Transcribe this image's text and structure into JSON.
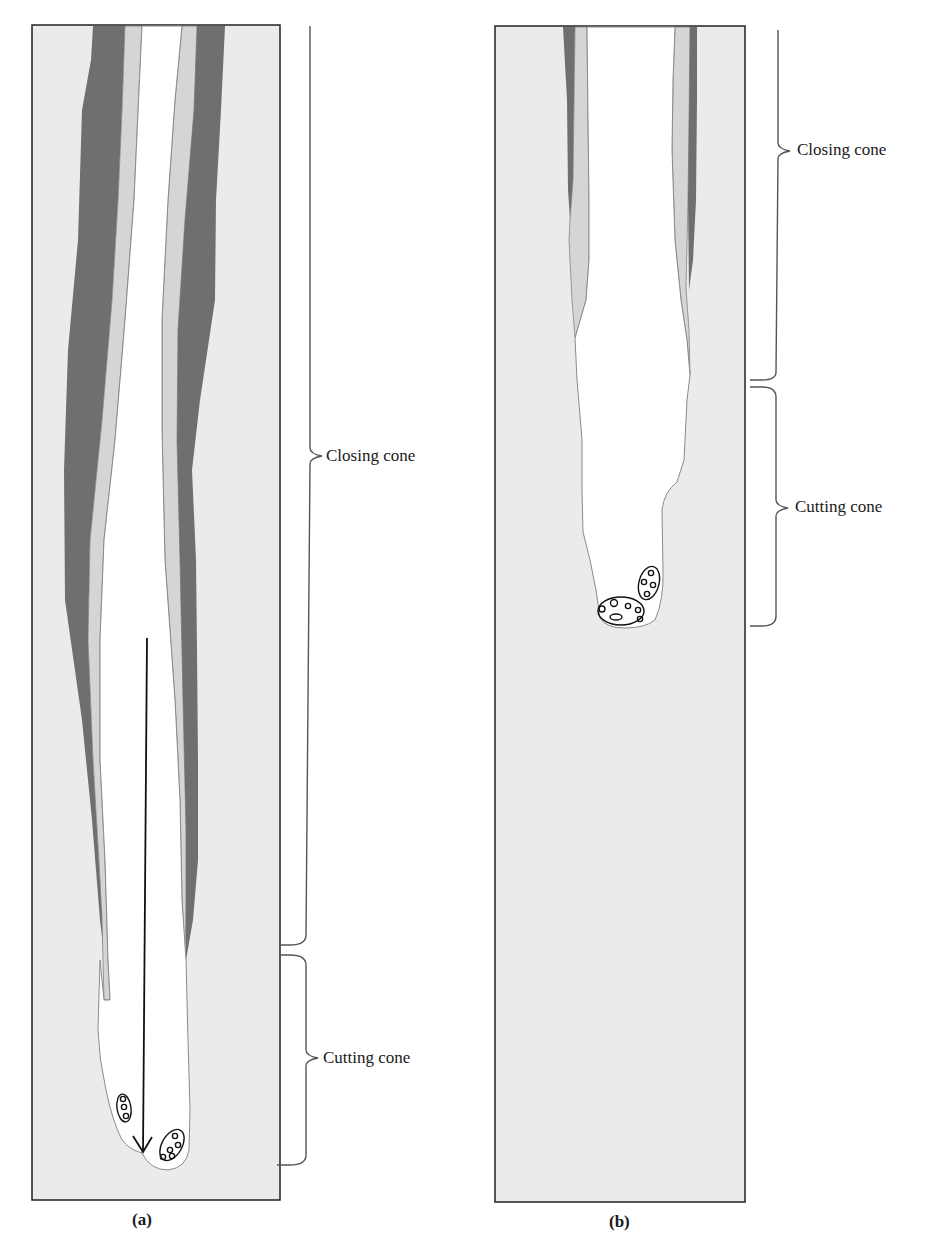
{
  "figure": {
    "colors": {
      "bone_background": "#ebebeb",
      "dark_lamella": "#6f6f6f",
      "light_lamella": "#d5d5d5",
      "canal": "#ffffff",
      "outline": "#222222",
      "brace": "#555555"
    },
    "panels": [
      {
        "id": "a",
        "caption": "(a)",
        "regions": [
          {
            "name": "closing-cone",
            "label": "Closing cone"
          },
          {
            "name": "cutting-cone",
            "label": "Cutting cone"
          }
        ],
        "arrow": {
          "direction": "down",
          "meaning": "direction of tunnel advance"
        },
        "cell_clusters": 2
      },
      {
        "id": "b",
        "caption": "(b)",
        "regions": [
          {
            "name": "closing-cone",
            "label": "Closing cone"
          },
          {
            "name": "cutting-cone",
            "label": "Cutting cone"
          }
        ],
        "cell_clusters": 2
      }
    ]
  }
}
